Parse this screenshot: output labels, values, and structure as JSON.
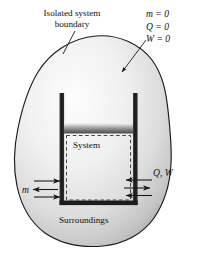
{
  "figure": {
    "width": 198,
    "height": 267,
    "background_color": "#ffffff"
  },
  "labels": {
    "boundary_line1": "Isolated system",
    "boundary_line2": "boundary",
    "system": "System",
    "surroundings": "Surroundings",
    "mass_flow": "m",
    "heat_work": "Q, W"
  },
  "equations": [
    {
      "name": "mass",
      "text": "m = 0"
    },
    {
      "name": "heat",
      "text": "Q = 0"
    },
    {
      "name": "work",
      "text": "W = 0"
    }
  ],
  "colors": {
    "blob_outline": "#1a1a1a",
    "blob_fill_light": "#fbfbfb",
    "blob_fill_mid": "#d8d8d8",
    "blob_fill_dark": "#b4b4b4",
    "cylinder_wall": "#1c1c1c",
    "piston_light": "#f2f2f2",
    "piston_dark": "#5a5a5a",
    "dashed_boundary": "#3a3a3a",
    "arrow": "#1a1a1a",
    "text": "#111111"
  },
  "geometry": {
    "cylinder_left_wall_x": 60,
    "cylinder_right_wall_x": 137,
    "cylinder_top_y": 93,
    "cylinder_bottom_y": 205,
    "piston_top_y": 123,
    "piston_bottom_y": 133
  }
}
